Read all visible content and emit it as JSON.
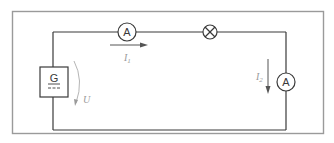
{
  "diagram": {
    "type": "electrical-circuit",
    "components": {
      "ammeter_top": {
        "symbol": "A",
        "label": "A"
      },
      "lamp": {
        "symbol": "lamp-cross"
      },
      "generator": {
        "symbol": "G",
        "label": "G",
        "dc_mark": "="
      },
      "ammeter_right": {
        "symbol": "A",
        "label": "A"
      }
    },
    "labels": {
      "current_1": "I",
      "current_1_sub": "1",
      "current_2": "I",
      "current_2_sub": "2",
      "voltage": "U"
    },
    "colors": {
      "wire": "#3a3a3a",
      "frame": "#9a9a9a",
      "annotation": "#9a9a9a"
    }
  }
}
